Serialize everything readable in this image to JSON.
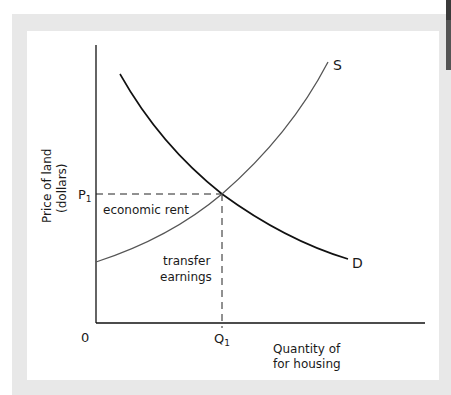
{
  "diagram": {
    "y_axis_label_line1": "Price of land",
    "y_axis_label_line2": "(dollars)",
    "x_axis_label_line1": "Quantity of",
    "x_axis_label_line2": "for housing",
    "origin_label": "0",
    "price_label": "P",
    "price_subscript": "1",
    "quantity_label": "Q",
    "quantity_subscript": "1",
    "supply_label": "S",
    "demand_label": "D",
    "region_upper_label": "economic rent",
    "region_lower_label_line1": "transfer",
    "region_lower_label_line2": "earnings"
  },
  "colors": {
    "frame": "#e8e8e8",
    "panel": "#ffffff",
    "demand_curve": "#111111",
    "supply_curve": "#555555",
    "axes": "#111111",
    "dashed_guides": "#222222",
    "scrollbar": "#555555"
  }
}
